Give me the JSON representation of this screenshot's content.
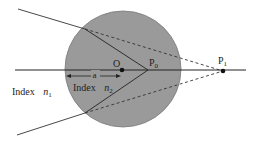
{
  "diagram": {
    "colors": {
      "sphere_fill": "#9a9a9a",
      "sphere_stroke": "#7a7a7a",
      "line": "#222222",
      "background": "#ffffff"
    },
    "labels": {
      "center": "O",
      "p0_main": "P",
      "p0_sub": "0",
      "p1_main": "P",
      "p1_sub": "1",
      "radius": "a",
      "outer_index_word": "Index",
      "outer_index_symbol": "n",
      "outer_index_sub": "1",
      "inner_index_word": "Index",
      "inner_index_symbol": "n",
      "inner_index_sub": "2"
    },
    "geometry": {
      "sphere": {
        "cx": 123,
        "cy": 69,
        "r": 58
      },
      "axis": {
        "x1": 15,
        "y1": 70,
        "x2": 246,
        "y2": 70
      },
      "point_O": {
        "x": 122,
        "y": 70
      },
      "point_P0": {
        "x": 148,
        "y": 70
      },
      "point_P1": {
        "x": 223,
        "y": 71
      },
      "upper_ray": {
        "start": {
          "x": 18,
          "y": 9
        },
        "entry": {
          "x": 85,
          "y": 29
        }
      },
      "lower_ray": {
        "start": {
          "x": 17,
          "y": 135
        },
        "entry": {
          "x": 85,
          "y": 113
        }
      }
    }
  }
}
